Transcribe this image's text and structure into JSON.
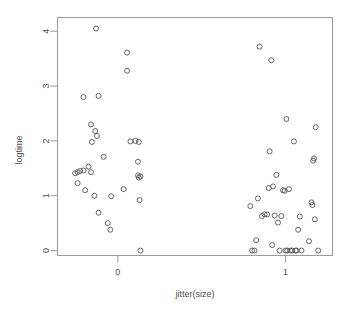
{
  "chart_data": {
    "type": "scatter",
    "title": "",
    "subtitle": "",
    "xlabel": "jitter(size)",
    "ylabel": "logtime",
    "grid": false,
    "legend": false,
    "legend_position": "none",
    "point_symbol": "open-circle",
    "point_color": "#555555",
    "frame_color": "#9a9a9a",
    "background_color": "#ffffff",
    "xlim": [
      -0.36,
      1.28
    ],
    "ylim": [
      -0.09,
      4.25
    ],
    "xticks": [
      0,
      1
    ],
    "xtick_labels": [
      "0",
      "1"
    ],
    "yticks": [
      0,
      1,
      2,
      3,
      4
    ],
    "ytick_labels": [
      "0",
      "1",
      "2",
      "3",
      "4"
    ],
    "series": [
      {
        "name": "observations",
        "x": [
          -0.13,
          -0.205,
          -0.115,
          -0.16,
          -0.135,
          -0.155,
          -0.125,
          -0.085,
          -0.225,
          -0.255,
          -0.24,
          -0.205,
          -0.16,
          -0.175,
          -0.14,
          -0.24,
          -0.195,
          -0.115,
          -0.06,
          -0.045,
          -0.04,
          0.035,
          0.055,
          0.055,
          0.075,
          0.105,
          0.12,
          0.12,
          0.125,
          0.13,
          0.135,
          0.135,
          0.125,
          0.79,
          0.8,
          0.815,
          0.825,
          0.835,
          0.845,
          0.86,
          0.875,
          0.89,
          0.9,
          0.905,
          0.915,
          0.92,
          0.925,
          0.935,
          0.945,
          0.955,
          0.965,
          0.975,
          0.985,
          0.995,
          1.0,
          1.005,
          1.01,
          1.02,
          1.03,
          1.04,
          1.05,
          1.06,
          1.065,
          1.075,
          1.085,
          1.095,
          1.14,
          1.155,
          1.16,
          1.165,
          1.17,
          1.175,
          1.18,
          1.195
        ],
        "y": [
          4.05,
          2.8,
          2.82,
          2.3,
          2.18,
          1.98,
          2.09,
          1.71,
          1.45,
          1.41,
          1.43,
          1.46,
          1.43,
          1.53,
          1.0,
          1.23,
          1.1,
          0.69,
          0.5,
          0.38,
          0.99,
          1.12,
          3.28,
          3.61,
          1.99,
          2.0,
          1.62,
          1.37,
          1.33,
          0.92,
          0.0,
          1.35,
          1.98,
          0.81,
          0.0,
          0.0,
          0.19,
          0.95,
          3.72,
          0.63,
          0.66,
          0.66,
          1.14,
          1.81,
          3.47,
          0.1,
          1.17,
          0.64,
          1.38,
          0.51,
          0.0,
          0.63,
          1.1,
          1.09,
          0.0,
          2.4,
          0.0,
          1.12,
          0.0,
          0.0,
          1.99,
          0.0,
          0.0,
          0.38,
          0.62,
          0.0,
          0.17,
          0.88,
          0.83,
          1.64,
          1.68,
          0.57,
          2.25,
          0.0
        ]
      }
    ]
  }
}
